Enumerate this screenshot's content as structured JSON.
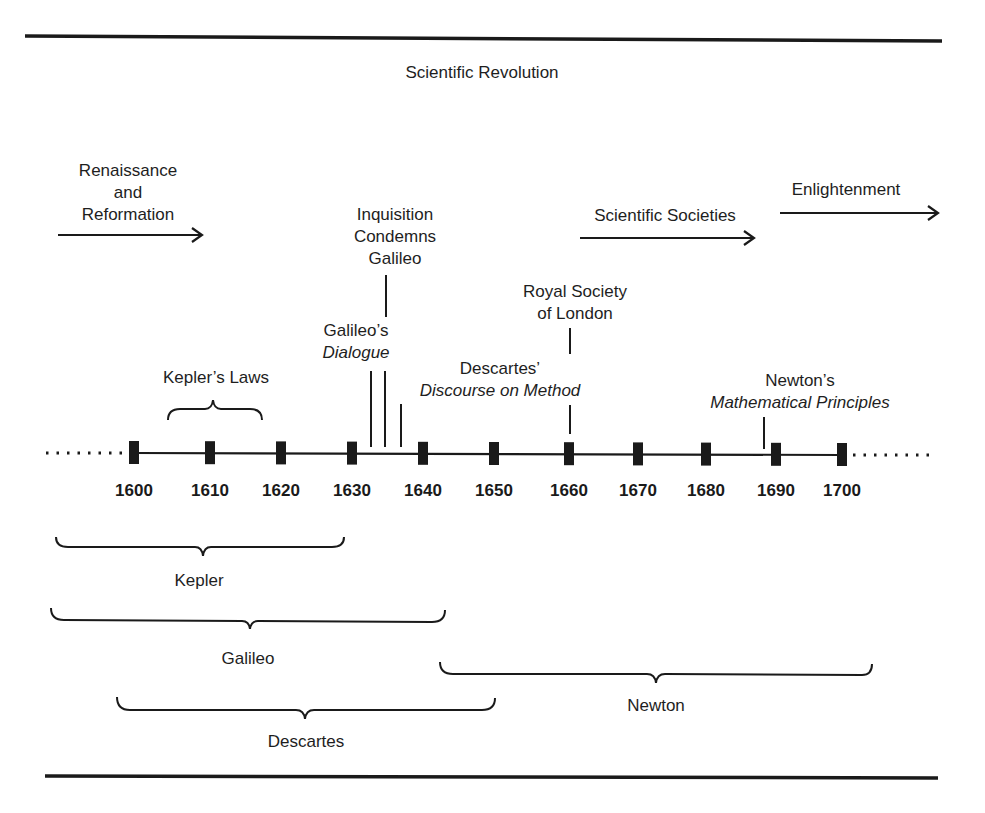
{
  "title": "Scientific Revolution",
  "colors": {
    "ink": "#1a1a1a",
    "background": "#ffffff"
  },
  "timeline": {
    "years": [
      "1600",
      "1610",
      "1620",
      "1630",
      "1640",
      "1650",
      "1660",
      "1670",
      "1680",
      "1690",
      "1700"
    ],
    "tick_x": [
      134,
      210,
      281,
      352,
      423,
      494,
      569,
      638,
      706,
      776,
      842
    ],
    "axis_y": 453
  },
  "movements": [
    {
      "id": "renaissance",
      "lines": [
        "Renaissance",
        "and",
        "Reformation"
      ],
      "arrow": [
        58,
        203,
        234
      ]
    },
    {
      "id": "societies",
      "lines": [
        "Scientific Societies"
      ],
      "arrow": [
        580,
        755,
        238
      ]
    },
    {
      "id": "enlightenment",
      "lines": [
        "Enlightenment"
      ],
      "arrow": [
        780,
        940,
        213
      ]
    }
  ],
  "events": [
    {
      "id": "kepler-laws",
      "text": "Kepler’s Laws",
      "start": 1605,
      "end": 1618
    },
    {
      "id": "galileo-dialogue",
      "line1": "Galileo’s",
      "line2_italic": "Dialogue",
      "year": 1632
    },
    {
      "id": "inquisition",
      "lines": [
        "Inquisition",
        "Condemns",
        "Galileo"
      ],
      "year": 1633
    },
    {
      "id": "descartes-discourse",
      "line1": "Descartes’",
      "line2_italic": "Discourse on Method",
      "year": 1637
    },
    {
      "id": "royal-society",
      "lines": [
        "Royal Society",
        "of London"
      ],
      "year": 1660
    },
    {
      "id": "newton-principles",
      "line1": "Newton’s",
      "line2_italic": "Mathematical Principles",
      "year": 1687
    }
  ],
  "lifespans": [
    {
      "id": "kepler",
      "name": "Kepler",
      "start": 1571,
      "end": 1630
    },
    {
      "id": "galileo",
      "name": "Galileo",
      "start": 1564,
      "end": 1642
    },
    {
      "id": "descartes",
      "name": "Descartes",
      "start": 1596,
      "end": 1650
    },
    {
      "id": "newton",
      "name": "Newton",
      "start": 1642,
      "end": 1727
    }
  ]
}
